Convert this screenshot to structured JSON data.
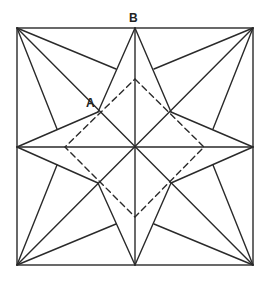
{
  "diagram": {
    "type": "geometric-construction",
    "stroke_color": "#2a2a2a",
    "labels": [
      {
        "text": "B",
        "x": 129,
        "y": 12
      },
      {
        "text": "A",
        "x": 86,
        "y": 97
      }
    ],
    "square": {
      "x1": 17,
      "y1": 28,
      "x2": 253,
      "y2": 265
    },
    "center": [
      135,
      147
    ],
    "inner_points": [
      [
        98,
        112
      ],
      [
        171,
        112
      ],
      [
        98,
        183
      ],
      [
        171,
        183
      ]
    ],
    "midpoints": {
      "top": [
        135,
        28
      ],
      "bottom": [
        135,
        265
      ],
      "left": [
        17,
        147
      ],
      "right": [
        253,
        147
      ]
    },
    "dashed_square": [
      [
        135,
        79
      ],
      [
        204,
        147
      ],
      [
        135,
        217
      ],
      [
        65,
        147
      ]
    ]
  }
}
